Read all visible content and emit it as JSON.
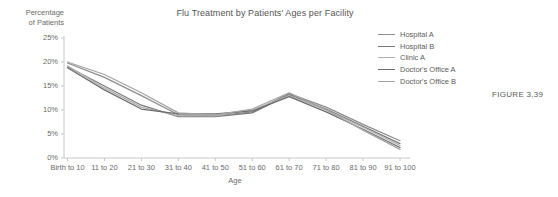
{
  "figure": {
    "caption": "FIGURE 3.39"
  },
  "chart_data": {
    "type": "line",
    "title": "Flu Treatment by Patients' Ages per Facility",
    "xlabel": "Age",
    "ylabel": "Percentage of Patients",
    "ylabel_line1": "Percentage",
    "ylabel_line2": "of Patients",
    "categories": [
      "Birth to 10",
      "11 to 20",
      "21 to 30",
      "31 to 40",
      "41 to 50",
      "51 to 60",
      "61 to 70",
      "71 to 80",
      "81 to 90",
      "91 to 100"
    ],
    "ylim": [
      0,
      25
    ],
    "yticks": [
      0,
      5,
      10,
      15,
      20,
      25
    ],
    "ytick_labels": [
      "0%",
      "5%",
      "10%",
      "15%",
      "20%",
      "25%"
    ],
    "grid": false,
    "legend_position": "right",
    "series": [
      {
        "name": "Hospital A",
        "color": "#8d8d8d",
        "values": [
          19.8,
          16.8,
          13.0,
          9.0,
          8.8,
          9.6,
          13.4,
          10.6,
          7.0,
          3.6
        ]
      },
      {
        "name": "Hospital B",
        "color": "#7a7a7a",
        "values": [
          19.0,
          15.0,
          11.0,
          8.6,
          8.6,
          9.4,
          13.2,
          10.2,
          6.6,
          3.0
        ]
      },
      {
        "name": "Clinic A",
        "color": "#b0b0b0",
        "values": [
          19.2,
          14.6,
          10.6,
          8.8,
          8.8,
          10.0,
          13.0,
          10.0,
          6.4,
          2.6
        ]
      },
      {
        "name": "Doctor's Office A",
        "color": "#6d6d6d",
        "values": [
          18.8,
          14.2,
          10.2,
          9.2,
          9.2,
          9.8,
          12.8,
          9.6,
          6.0,
          2.2
        ]
      },
      {
        "name": "Doctor's Office B",
        "color": "#a3a3a3",
        "values": [
          20.0,
          17.4,
          13.6,
          9.4,
          9.0,
          10.2,
          13.6,
          10.0,
          5.8,
          1.8
        ]
      }
    ]
  },
  "axis": {
    "axis_color": "#c8c8c8"
  }
}
